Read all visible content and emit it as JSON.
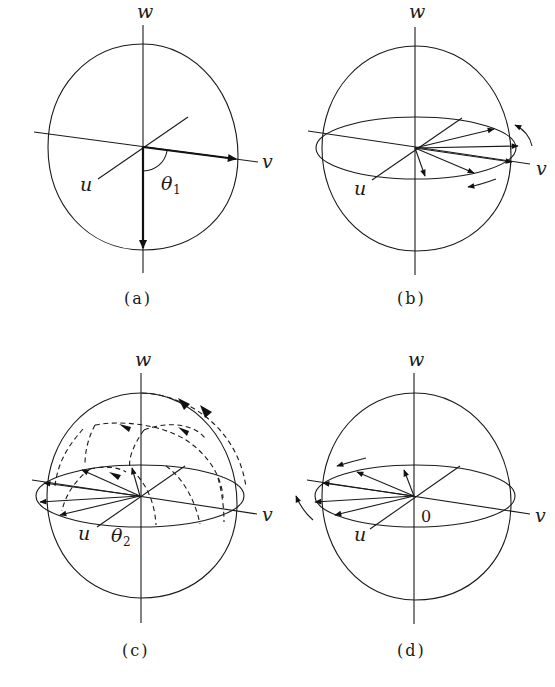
{
  "figure": {
    "panels": [
      {
        "id": "a",
        "caption": "(a)",
        "axes": {
          "w": "w",
          "v": "v",
          "u": "u"
        },
        "angle_label": {
          "symbol": "θ",
          "subscript": "1"
        },
        "description": "Spin vector pointing down the -w axis; thick arrow along v; angle θ1 between them"
      },
      {
        "id": "b",
        "caption": "(b)",
        "axes": {
          "w": "w",
          "v": "v",
          "u": "u"
        },
        "description": "Vectors fanning in the equatorial (u-v) plane precessing around w; curved rotation arrows"
      },
      {
        "id": "c",
        "caption": "(c)",
        "axes": {
          "w": "w",
          "v": "v",
          "u": "u"
        },
        "angle_label": {
          "symbol": "θ",
          "subscript": "2"
        },
        "description": "Dashed meridian arcs showing vectors rotating over the top of the sphere toward -v side"
      },
      {
        "id": "d",
        "caption": "(d)",
        "axes": {
          "w": "w",
          "v": "v",
          "u": "u"
        },
        "origin_label": "0",
        "description": "Vectors fanning on the -v side of the equatorial plane with rotation arrows"
      }
    ]
  }
}
